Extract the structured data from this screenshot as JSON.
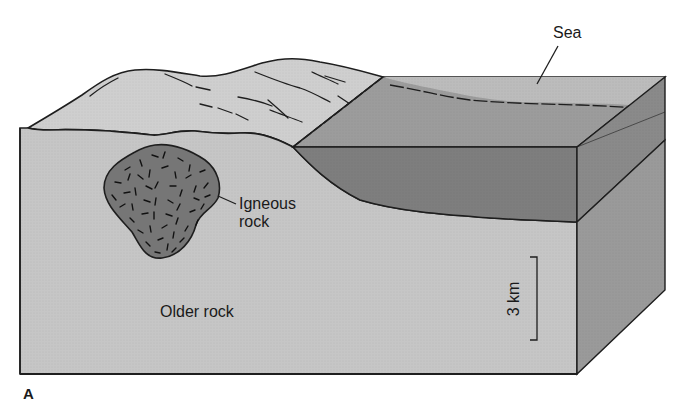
{
  "figure": {
    "panel_label": "A",
    "labels": {
      "sea": "Sea",
      "igneous_rock_line1": "Igneous",
      "igneous_rock_line2": "rock",
      "older_rock": "Older rock",
      "scale": "3 km"
    },
    "colors": {
      "background": "#ffffff",
      "older_rock_front": "#c6c6c6",
      "older_rock_side": "#9a9a9a",
      "land_surface": "#cfcfcf",
      "sea_surface": "#b8b8b8",
      "sediment_top": "#9c9c9c",
      "sediment_front": "#7e7e7e",
      "sediment_side": "#8a8a8a",
      "igneous": "#767676",
      "outline": "#1e1e1e"
    }
  }
}
